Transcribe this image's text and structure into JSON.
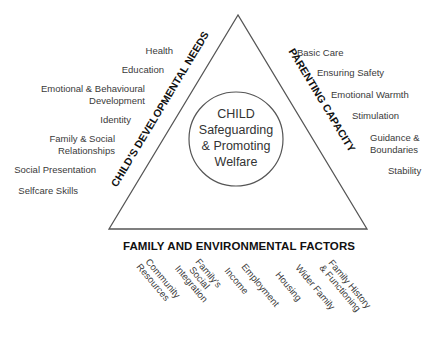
{
  "center": {
    "lines": [
      "CHILD",
      "Safeguarding",
      "& Promoting",
      "Welfare"
    ]
  },
  "left_side": {
    "title": "CHILD'S DEVELOPMENTAL NEEDS",
    "items": [
      {
        "lines": [
          "Health"
        ]
      },
      {
        "lines": [
          "Education"
        ]
      },
      {
        "lines": [
          "Emotional & Behavioural",
          "Development"
        ]
      },
      {
        "lines": [
          "Identity"
        ]
      },
      {
        "lines": [
          "Family & Social",
          "Relationships"
        ]
      },
      {
        "lines": [
          "Social Presentation"
        ]
      },
      {
        "lines": [
          "Selfcare Skills"
        ]
      }
    ]
  },
  "right_side": {
    "title": "PARENTING CAPACITY",
    "items": [
      {
        "lines": [
          "Basic Care"
        ]
      },
      {
        "lines": [
          "Ensuring Safety"
        ]
      },
      {
        "lines": [
          "Emotional Warmth"
        ]
      },
      {
        "lines": [
          "Stimulation"
        ]
      },
      {
        "lines": [
          "Guidance &",
          "Boundaries"
        ]
      },
      {
        "lines": [
          "Stability"
        ]
      }
    ]
  },
  "bottom_side": {
    "title": "FAMILY AND ENVIRONMENTAL FACTORS",
    "items": [
      {
        "lines": [
          "Community",
          "Resources"
        ]
      },
      {
        "lines": [
          "Family's",
          "Social",
          "Integration"
        ]
      },
      {
        "lines": [
          "Income"
        ]
      },
      {
        "lines": [
          "Employment"
        ]
      },
      {
        "lines": [
          "Housing"
        ]
      },
      {
        "lines": [
          "Wider Family"
        ]
      },
      {
        "lines": [
          "Family History",
          "& Functioning"
        ]
      }
    ]
  },
  "colors": {
    "line": "#555555",
    "text": "#333333",
    "title": "#111111",
    "background": "#ffffff"
  }
}
